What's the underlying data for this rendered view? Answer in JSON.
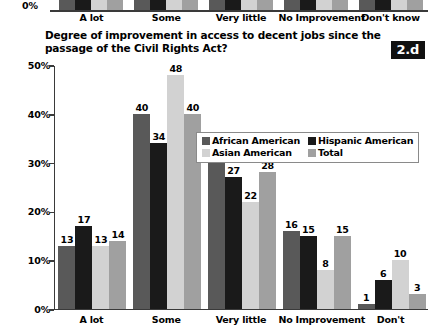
{
  "badge": {
    "label": "2.d"
  },
  "title": {
    "text": "Degree of improvement in access to decent jobs since the passage of the Civil Rights Act?"
  },
  "top_remnant": {
    "zero_label": "0%",
    "categories": [
      "A lot",
      "Some",
      "Very little",
      "No Improvement",
      "Don't know"
    ]
  },
  "legend": {
    "items": [
      {
        "label": "African American",
        "color": "#595959"
      },
      {
        "label": "Hispanic American",
        "color": "#1a1a1a"
      },
      {
        "label": "Asian American",
        "color": "#d2d2d2"
      },
      {
        "label": "Total",
        "color": "#a0a0a0"
      }
    ]
  },
  "chart_data": {
    "type": "bar",
    "title": "Degree of improvement in access to decent jobs since the passage of the Civil Rights Act?",
    "xlabel": "",
    "ylabel": "",
    "ylim": [
      0,
      50
    ],
    "yticks": [
      0,
      10,
      20,
      30,
      40,
      50
    ],
    "ytick_labels": [
      "0%",
      "10%",
      "20%",
      "30%",
      "40%",
      "50%"
    ],
    "grid": false,
    "legend_position": "upper-center",
    "value_suffix": "",
    "categories": [
      "A lot",
      "Some",
      "Very little",
      "No Improvement",
      "Don't"
    ],
    "series": [
      {
        "name": "African American",
        "color": "#595959",
        "values": [
          13,
          40,
          30,
          16,
          1
        ]
      },
      {
        "name": "Hispanic American",
        "color": "#1a1a1a",
        "values": [
          17,
          34,
          27,
          15,
          6
        ]
      },
      {
        "name": "Asian American",
        "color": "#d2d2d2",
        "values": [
          13,
          48,
          22,
          8,
          10
        ]
      },
      {
        "name": "Total",
        "color": "#a0a0a0",
        "values": [
          14,
          40,
          28,
          15,
          3
        ]
      }
    ]
  }
}
